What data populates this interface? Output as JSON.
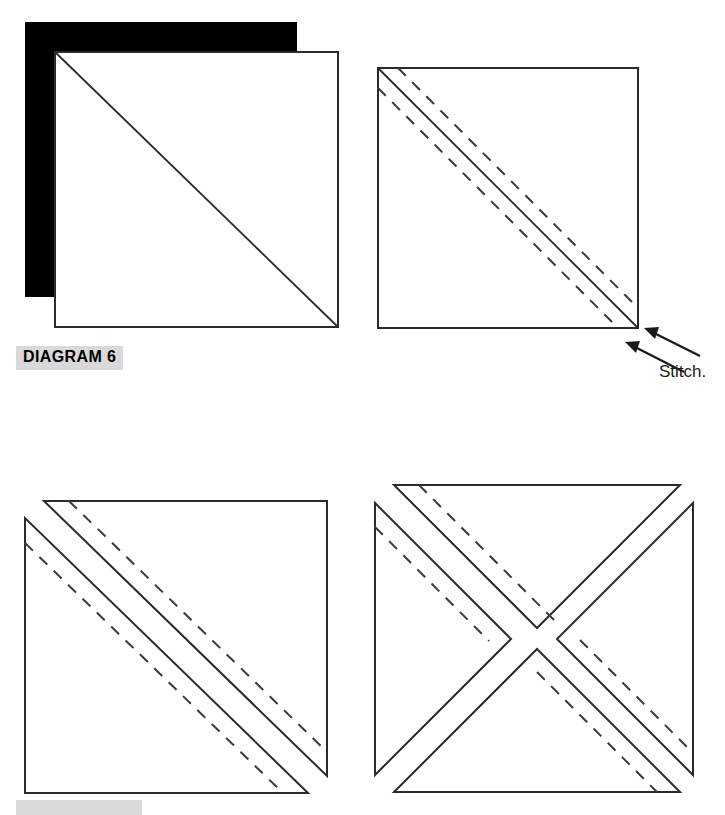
{
  "page": {
    "width": 725,
    "height": 815,
    "background_color": "#ffffff",
    "kind": "quilting instruction diagram"
  },
  "labels": {
    "diagram_6": "DIAGRAM 6",
    "diagram_next_partial": "DIAGRAM 7",
    "label_background_color": "#d9d9d9"
  },
  "annotations": {
    "stitch_caption": "Stitch."
  },
  "colors": {
    "fabric_dark": "#000000",
    "fabric_light": "#ffffff",
    "outline": "#2b2b2b",
    "dashed_guide": "#3a3a3a",
    "arrow": "#1a1a1a",
    "label_highlight": "#d9d9d9"
  },
  "panels": [
    {
      "id": "panel-top-left",
      "name": "layered-squares",
      "description": "Dark fabric square layered beneath a light fabric square offset down and right, with a single solid diagonal drawn corner to corner on the light square.",
      "dark_square": {
        "x": 25,
        "y": 22,
        "width": 272,
        "height": 275
      },
      "light_square": {
        "x": 55,
        "y": 52,
        "width": 283,
        "height": 275
      },
      "diagonal": {
        "x1": 55,
        "y1": 52,
        "x2": 338,
        "y2": 327
      },
      "dashed_lines": 0
    },
    {
      "id": "panel-top-right",
      "name": "marked-square-with-stitch-lines",
      "description": "Light fabric square with a solid diagonal center line and two dashed stitching lines running parallel on either side of the diagonal.",
      "square": {
        "x": 378,
        "y": 68,
        "width": 260,
        "height": 260
      },
      "diagonal": {
        "x1": 378,
        "y1": 68,
        "x2": 638,
        "y2": 328
      },
      "dashed_lines": 2,
      "dashed_offset_px": 20,
      "arrows": 2
    },
    {
      "id": "panel-bottom-left",
      "name": "cut-halves-offset",
      "description": "Square cut along the diagonal into two triangles, slid apart so the halves are offset; each half carries a solid cut edge and a dashed stitching line.",
      "upper_triangle": {
        "apex_x": 44,
        "apex_y": 501
      },
      "lower_triangle": {
        "apex_x": 25,
        "apex_y": 518
      },
      "dashed_lines": 2
    },
    {
      "id": "panel-bottom-right",
      "name": "four-triangle-pinwheel",
      "description": "Square cut on both diagonals into four triangles arranged as an X pinwheel with narrow gaps; dashed stitching lines follow the upper-left and lower-right arms.",
      "triangles": 4,
      "dashed_lines": 2
    }
  ]
}
